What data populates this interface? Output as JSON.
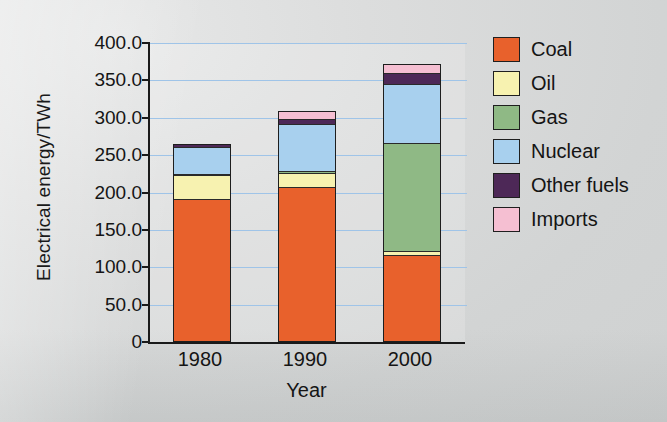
{
  "chart_data": {
    "type": "bar",
    "stacked": true,
    "title": "",
    "xlabel": "Year",
    "ylabel": "Electrical energy/TWh",
    "categories": [
      "1980",
      "1990",
      "2000"
    ],
    "ylim": [
      0,
      400
    ],
    "ytick_values": [
      0,
      50,
      100,
      150,
      200,
      250,
      300,
      350,
      400
    ],
    "ytick_labels": [
      "0",
      "50.0",
      "100.0",
      "150.0",
      "200.0",
      "250.0",
      "300.0",
      "350.0",
      "400.0"
    ],
    "grid": true,
    "grid_color": "#9fc4e8",
    "legend_position": "right",
    "series": [
      {
        "name": "Coal",
        "color": "#e8612c",
        "values": [
          190,
          207,
          115
        ]
      },
      {
        "name": "Oil",
        "color": "#f7f2b0",
        "values": [
          33,
          18,
          5
        ]
      },
      {
        "name": "Gas",
        "color": "#8fb985",
        "values": [
          2,
          3,
          145
        ]
      },
      {
        "name": "Nuclear",
        "color": "#a8d0ee",
        "values": [
          36,
          63,
          80
        ]
      },
      {
        "name": "Other fuels",
        "color": "#4d2857",
        "values": [
          4,
          7,
          15
        ]
      },
      {
        "name": "Imports",
        "color": "#f5bfd2",
        "values": [
          0,
          11,
          12
        ]
      }
    ],
    "totals": [
      265,
      309,
      372
    ]
  },
  "legend": {
    "items": [
      {
        "label": "Coal",
        "color": "#e8612c"
      },
      {
        "label": "Oil",
        "color": "#f7f2b0"
      },
      {
        "label": "Gas",
        "color": "#8fb985"
      },
      {
        "label": "Nuclear",
        "color": "#a8d0ee"
      },
      {
        "label": "Other fuels",
        "color": "#4d2857"
      },
      {
        "label": "Imports",
        "color": "#f5bfd2"
      }
    ]
  }
}
